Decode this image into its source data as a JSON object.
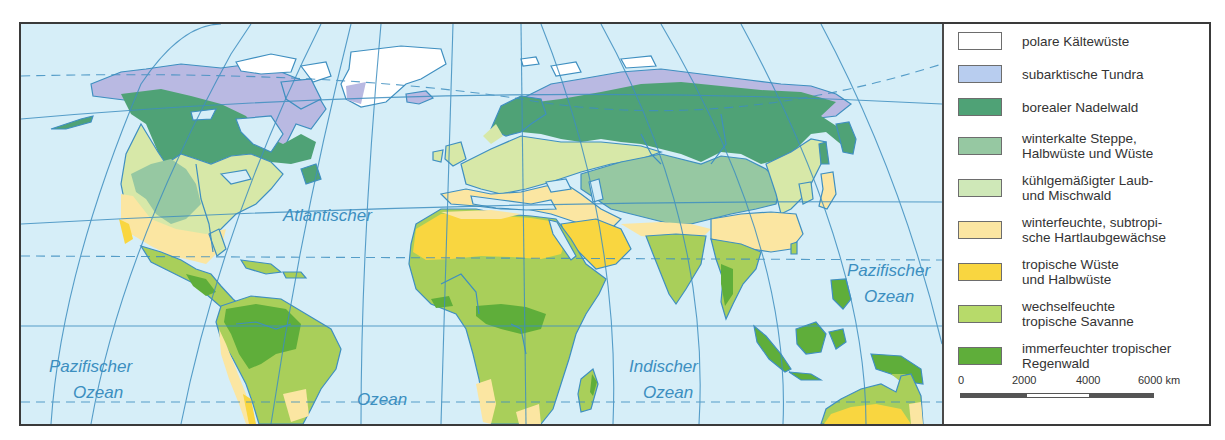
{
  "map": {
    "ocean_labels": [
      {
        "id": "atlantic-top",
        "lines": [
          "Atlantischer"
        ],
        "x": 262,
        "y": 197
      },
      {
        "id": "atlantic-bottom",
        "lines": [
          "Ozean"
        ],
        "x": 355,
        "y": 381
      },
      {
        "id": "pacific-west",
        "lines": [
          "Pazifischer",
          "Ozean"
        ],
        "x": 88,
        "y": 368
      },
      {
        "id": "indian",
        "lines": [
          "Indischer",
          "Ozean"
        ],
        "x": 666,
        "y": 368
      },
      {
        "id": "pacific-east",
        "lines": [
          "Pazifischer",
          "Ozean"
        ],
        "x": 871,
        "y": 273
      }
    ],
    "colors": {
      "ocean": "#d6eef8",
      "graticule": "#3f8fc0",
      "coast": "#3f8fc0",
      "polar_ice": "#ffffff",
      "tundra": "#b9b9e2",
      "boreal": "#4fa276",
      "steppe": "#96c8a2",
      "temperate": "#d7e8a8",
      "mediterranean": "#fbe6a2",
      "desert": "#f9d640",
      "savanna": "#a9cf5a",
      "rainforest": "#5fae3a"
    }
  },
  "legend": {
    "items": [
      {
        "label": "polare Kältewüste",
        "color": "#ffffff"
      },
      {
        "label": "subarktische Tundra",
        "color": "#b8cdef"
      },
      {
        "label": "borealer Nadelwald",
        "color": "#4fa276"
      },
      {
        "label": "winterkalte Steppe,\nHalbwüste und Wüste",
        "color": "#96c8a2"
      },
      {
        "label": "kühlgemäßigter Laub-\nund Mischwald",
        "color": "#cfe8b8"
      },
      {
        "label": "winterfeuchte, subtropi-\nsche Hartlaubgewächse",
        "color": "#fbe6a2"
      },
      {
        "label": "tropische Wüste\nund Halbwüste",
        "color": "#f9d640"
      },
      {
        "label": "wechselfeuchte\ntropische Savanne",
        "color": "#b7da6a"
      },
      {
        "label": "immerfeuchter tropischer\nRegenwald",
        "color": "#5fae3a"
      }
    ],
    "scale": {
      "ticks": [
        "0",
        "2000",
        "4000",
        "6000 km"
      ]
    }
  }
}
